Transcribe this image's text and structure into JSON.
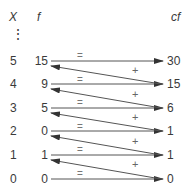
{
  "headers": {
    "x": "X",
    "f": "f",
    "cf": "cf"
  },
  "dots": "⋮",
  "rows": [
    {
      "x": "5",
      "f": "15",
      "cf": "30"
    },
    {
      "x": "4",
      "f": "9",
      "cf": "15"
    },
    {
      "x": "3",
      "f": "5",
      "cf": "6"
    },
    {
      "x": "2",
      "f": "0",
      "cf": "1"
    },
    {
      "x": "1",
      "f": "1",
      "cf": "1"
    },
    {
      "x": "0",
      "f": "0",
      "cf": "0"
    }
  ],
  "symbols": {
    "equals": "=",
    "plus": "+"
  },
  "colors": {
    "ink": "#3a3a3a",
    "arrow": "#444444"
  }
}
